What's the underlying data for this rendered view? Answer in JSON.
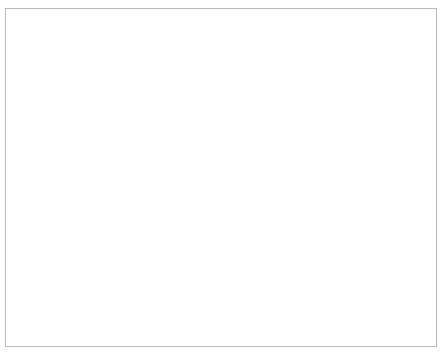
{
  "chart_data": {
    "type": "line",
    "title": "",
    "subtitle": "",
    "xlabel": "Multitasking-Fähigkeit",
    "ylabel": "Aufgabenleistung",
    "xlim": [
      -3.0,
      3.0
    ],
    "ylim": [
      -2.0,
      2.0
    ],
    "xticks": [
      "−3.0",
      "−2.0",
      "−1.0",
      "0.0",
      "1.0",
      "2.0",
      "3.0"
    ],
    "xtick_values": [
      -3.0,
      -2.0,
      -1.0,
      0.0,
      1.0,
      2.0,
      3.0
    ],
    "yticks": [
      "2.0",
      "1.0",
      "0.0",
      "−1.0",
      "−2.0"
    ],
    "ytick_values": [
      2.0,
      1.0,
      0.0,
      -1.0,
      -2.0
    ],
    "grid": false,
    "legend_position": "top-right",
    "legend_title": "Polychronizität",
    "series": [
      {
        "name": "+1 SD",
        "style": "solid",
        "color": "#333333",
        "x": [
          -3.0,
          3.0
        ],
        "values": [
          -0.77,
          0.56
        ]
      },
      {
        "name": "−1 SD",
        "style": "dashed",
        "color": "#333333",
        "x": [
          -3.0,
          3.0
        ],
        "values": [
          -0.17,
          0.16
        ]
      }
    ]
  },
  "legend": {
    "title": "Polychronizität",
    "entries": [
      {
        "label": "+1 SD",
        "style": "solid"
      },
      {
        "label": "−1 SD",
        "style": "dashed"
      }
    ]
  },
  "axes": {
    "x_title": "Multitasking-Fähigkeit",
    "y_title": "Aufgabenleistung"
  },
  "colors": {
    "line": "#333333",
    "axis": "#555555",
    "frame": "#b9b9b9",
    "text": "#3f3f3f",
    "background": "#ffffff"
  }
}
